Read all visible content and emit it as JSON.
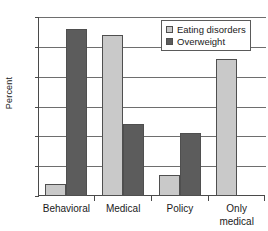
{
  "chart_data": {
    "type": "bar",
    "title": "",
    "xlabel": "",
    "ylabel": "Percent",
    "ylim": [
      0,
      60
    ],
    "yticks": [
      0,
      10,
      20,
      30,
      40,
      50,
      60
    ],
    "grid": true,
    "legend_position": "top-right",
    "categories": [
      "Behavioral",
      "Medical",
      "Policy",
      "Only medical"
    ],
    "category_lines": [
      [
        "Behavioral"
      ],
      [
        "Medical"
      ],
      [
        "Policy"
      ],
      [
        "Only",
        "medical"
      ]
    ],
    "series": [
      {
        "name": "Eating disorders",
        "color": "#c9c9c9",
        "values": [
          4,
          54,
          7,
          46
        ]
      },
      {
        "name": "Overweight",
        "color": "#5c5c5c",
        "values": [
          56,
          24,
          21,
          null
        ]
      }
    ]
  },
  "axis": {
    "y_title": "Percent",
    "y_tick_labels": [
      "60",
      "50",
      "40",
      "30",
      "20",
      "10",
      "0"
    ]
  },
  "legend": {
    "items": [
      {
        "label": "Eating disorders",
        "swatch": "light"
      },
      {
        "label": "Overweight",
        "swatch": "dark"
      }
    ]
  },
  "x_axis": {
    "labels": [
      {
        "line1": "Behavioral",
        "line2": ""
      },
      {
        "line1": "Medical",
        "line2": ""
      },
      {
        "line1": "Policy",
        "line2": ""
      },
      {
        "line1": "Only",
        "line2": "medical"
      }
    ]
  }
}
